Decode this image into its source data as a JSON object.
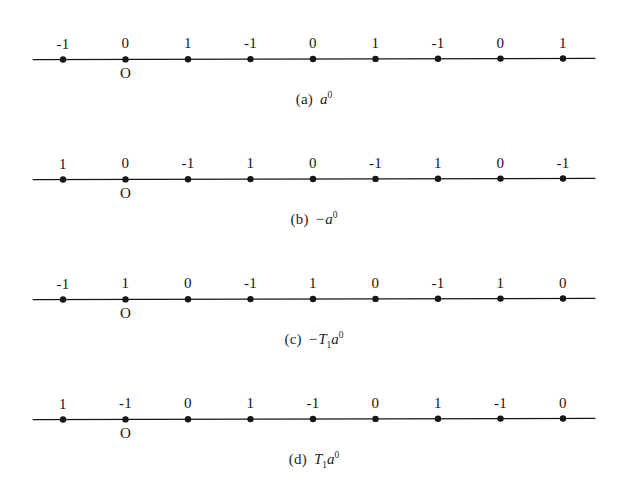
{
  "figure": {
    "background_color": "#ffffff",
    "ink_color": "#161616",
    "panel_count": 4,
    "axis": {
      "line_start_x": 33,
      "line_end_x": 595,
      "first_dot_x": 63,
      "dot_spacing": 62.5,
      "dot_count": 9,
      "dot_radius": 3.2,
      "line_width": 1.1
    },
    "panels": [
      {
        "id": "panel-a",
        "top": 0,
        "line_y": 59,
        "labels": [
          "-1",
          "0",
          "1",
          "-1",
          "0",
          "1",
          "-1",
          "0",
          "1"
        ],
        "origin_label": "O",
        "origin_index": 1,
        "caption_tag": "(a)",
        "caption_base": "a",
        "caption_exponent": "0",
        "caption_sign": "",
        "caption_operator": "",
        "caption_operator_sub": "",
        "caption_plain": "(a) a0"
      },
      {
        "id": "panel-b",
        "top": 120,
        "line_y": 179,
        "labels": [
          "1",
          "0",
          "-1",
          "1",
          "0",
          "-1",
          "1",
          "0",
          "-1"
        ],
        "origin_label": "O",
        "origin_index": 1,
        "caption_tag": "(b)",
        "caption_base": "a",
        "caption_exponent": "0",
        "caption_sign": "−",
        "caption_operator": "",
        "caption_operator_sub": "",
        "caption_plain": "(b) -a0"
      },
      {
        "id": "panel-c",
        "top": 240,
        "line_y": 299,
        "labels": [
          "-1",
          "1",
          "0",
          "-1",
          "1",
          "0",
          "-1",
          "1",
          "0"
        ],
        "origin_label": "O",
        "origin_index": 1,
        "caption_tag": "(c)",
        "caption_base": "a",
        "caption_exponent": "0",
        "caption_sign": "−",
        "caption_operator": "T",
        "caption_operator_sub": "1",
        "caption_plain": "(c) -T1a0"
      },
      {
        "id": "panel-d",
        "top": 360,
        "line_y": 419,
        "labels": [
          "1",
          "-1",
          "0",
          "1",
          "-1",
          "0",
          "1",
          "-1",
          "0"
        ],
        "origin_label": "O",
        "origin_index": 1,
        "caption_tag": "(d)",
        "caption_base": "a",
        "caption_exponent": "0",
        "caption_sign": "",
        "caption_operator": "T",
        "caption_operator_sub": "1",
        "caption_plain": "(d) T1a0"
      }
    ]
  }
}
